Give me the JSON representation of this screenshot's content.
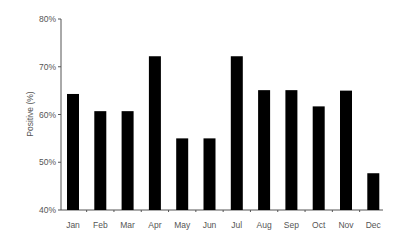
{
  "chart_data": {
    "type": "bar",
    "title": "",
    "xlabel": "",
    "ylabel": "Positive (%)",
    "categories": [
      "Jan",
      "Feb",
      "Mar",
      "Apr",
      "May",
      "Jun",
      "Jul",
      "Aug",
      "Sep",
      "Oct",
      "Nov",
      "Dec"
    ],
    "values": [
      64.3,
      60.7,
      60.7,
      72.2,
      55.0,
      55.0,
      72.2,
      65.1,
      65.1,
      61.7,
      65.0,
      47.7
    ],
    "ylim": [
      40,
      80
    ],
    "yticks": [
      "40%",
      "50%",
      "60%",
      "70%",
      "80%"
    ],
    "ytick_values": [
      40,
      50,
      60,
      70,
      80
    ],
    "grid": false,
    "legend": null,
    "bar_color": "#000000"
  }
}
